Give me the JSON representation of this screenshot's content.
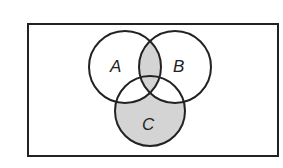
{
  "diagram": {
    "type": "venn",
    "sets": [
      {
        "label": "A",
        "cx": 125,
        "cy": 67,
        "r": 36
      },
      {
        "label": "B",
        "cx": 175,
        "cy": 67,
        "r": 36
      },
      {
        "label": "C",
        "cx": 150,
        "cy": 111,
        "r": 35
      }
    ],
    "universe": {
      "x": 28,
      "y": 24,
      "width": 250,
      "height": 132
    },
    "shaded_regions": [
      "A∩B",
      "C − (A ∪ B)"
    ],
    "colors": {
      "stroke": "#222222",
      "shade": "#d4d4d4",
      "background": "#ffffff"
    }
  },
  "labels": {
    "a": "A",
    "b": "B",
    "c": "C"
  }
}
